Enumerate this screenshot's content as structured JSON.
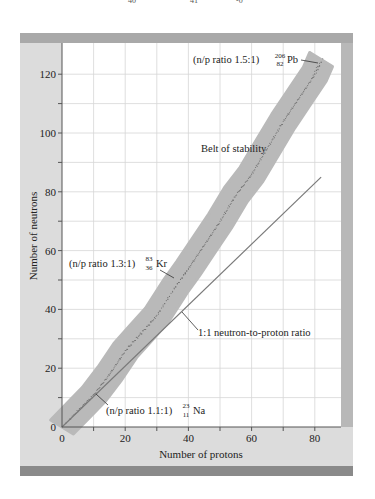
{
  "chart_data": {
    "type": "scatter",
    "title": "",
    "xlabel": "Number of protons",
    "ylabel": "Number of neutrons",
    "xlim": [
      0,
      88
    ],
    "ylim": [
      0,
      130
    ],
    "xticks": [
      0,
      20,
      40,
      60,
      80
    ],
    "xticks_minor": [
      10,
      30,
      50,
      70,
      90
    ],
    "yticks": [
      0,
      20,
      40,
      60,
      80,
      100,
      120
    ],
    "yticks_minor": [
      10,
      30,
      50,
      70,
      90,
      110
    ],
    "grid": true,
    "series": [
      {
        "name": "Belt of stability",
        "kind": "band",
        "center": [
          [
            0,
            0
          ],
          [
            5,
            5.5
          ],
          [
            10,
            11
          ],
          [
            15,
            18
          ],
          [
            20,
            26
          ],
          [
            25,
            32
          ],
          [
            30,
            38
          ],
          [
            36,
            48
          ],
          [
            40,
            54
          ],
          [
            45,
            62
          ],
          [
            50,
            70
          ],
          [
            55,
            79
          ],
          [
            60,
            86
          ],
          [
            65,
            95
          ],
          [
            70,
            104
          ],
          [
            75,
            112
          ],
          [
            80,
            120
          ],
          [
            82,
            125
          ]
        ],
        "half_width": 4
      },
      {
        "name": "1:1 neutron-to-proton ratio",
        "kind": "line",
        "points": [
          [
            0,
            0
          ],
          [
            82,
            85
          ]
        ]
      }
    ],
    "annotations": [
      {
        "text": "(n/p ratio 1.5:1)",
        "isotope": "Pb",
        "mass": "206",
        "atomic": "82",
        "point": [
          82,
          124
        ]
      },
      {
        "text": "Belt of stability",
        "point": [
          45,
          100
        ]
      },
      {
        "text": "(n/p ratio 1.3:1)",
        "isotope": "Kr",
        "mass": "83",
        "atomic": "36",
        "point": [
          36,
          47
        ]
      },
      {
        "text": "1:1 neutron-to-proton ratio",
        "point": [
          34,
          36
        ]
      },
      {
        "text": "(n/p ratio 1.1:1)",
        "isotope": "Na",
        "mass": "23",
        "atomic": "11",
        "point": [
          11,
          12
        ]
      }
    ]
  },
  "labels": {
    "pb": {
      "prefix": "(n/p ratio 1.5:1)",
      "mass": "206",
      "atomic": "82",
      "symbol": "Pb"
    },
    "belt": "Belt of stability",
    "kr": {
      "prefix": "(n/p ratio 1.3:1)",
      "mass": "83",
      "atomic": "36",
      "symbol": "Kr"
    },
    "ratio_line": "1:1 neutron-to-proton ratio",
    "na": {
      "prefix": "(n/p ratio 1.1:1)",
      "mass": "23",
      "atomic": "11",
      "symbol": "Na"
    },
    "xlabel": "Number of protons",
    "ylabel": "Number of neutrons",
    "xtick_labels": [
      "0",
      "20",
      "40",
      "60",
      "80"
    ],
    "ytick_labels": [
      "0",
      "20",
      "40",
      "60",
      "80",
      "100",
      "120"
    ]
  },
  "colors": {
    "panel": "#dcdcdc",
    "panel_dark": "#8a8a8a",
    "plot_bg": "#ffffff",
    "grid": "#d6d6d6",
    "band": "#b9b9b9",
    "dots": "#6d6d6d",
    "line": "#7a7a7a",
    "text": "#222222"
  }
}
